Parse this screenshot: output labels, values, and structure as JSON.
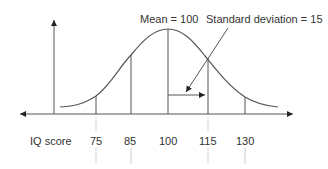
{
  "diagram": {
    "annotations": {
      "mean": "Mean = 100",
      "sd": "Standard deviation  = 15"
    },
    "x_axis_label": "IQ score",
    "ticks": [
      "75",
      "85",
      "100",
      "115",
      "130"
    ],
    "colors": {
      "line": "#555555",
      "text": "#333333",
      "dotted": "#aaaaaa"
    }
  }
}
